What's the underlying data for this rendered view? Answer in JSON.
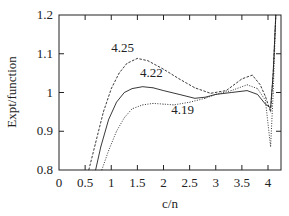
{
  "chart_data": {
    "type": "line",
    "title": "",
    "xlabel": "c/n",
    "ylabel": "Expt/function",
    "xlim": [
      0,
      4.3
    ],
    "ylim": [
      0.8,
      1.2
    ],
    "xticks": [
      0,
      0.5,
      1,
      1.5,
      2,
      2.5,
      3,
      3.5,
      4
    ],
    "xtick_labels": [
      "0",
      "0.5",
      "1",
      "1.5",
      "2",
      "2.5",
      "3",
      "3.5",
      "4"
    ],
    "yticks": [
      0.8,
      0.9,
      1.0,
      1.1,
      1.2
    ],
    "ytick_labels": [
      "0.8",
      "0.9",
      "1",
      "1.1",
      "1.2"
    ],
    "grid": false,
    "legend": "none",
    "series": [
      {
        "name": "4.25",
        "style": "dashed",
        "x": [
          0.57,
          0.7,
          0.85,
          1.0,
          1.15,
          1.3,
          1.5,
          1.7,
          2.0,
          2.3,
          2.6,
          2.9,
          3.2,
          3.5,
          3.7,
          3.85,
          3.95,
          4.05,
          4.1,
          4.15
        ],
        "y": [
          0.8,
          0.87,
          0.95,
          1.01,
          1.05,
          1.075,
          1.088,
          1.082,
          1.06,
          1.035,
          1.012,
          0.998,
          1.005,
          1.035,
          1.045,
          1.02,
          0.99,
          0.95,
          1.05,
          1.2
        ]
      },
      {
        "name": "4.22",
        "style": "solid",
        "x": [
          0.7,
          0.8,
          0.95,
          1.1,
          1.25,
          1.4,
          1.6,
          1.8,
          2.0,
          2.3,
          2.6,
          2.8,
          3.0,
          3.3,
          3.6,
          3.8,
          3.95,
          4.05,
          4.1,
          4.15
        ],
        "y": [
          0.8,
          0.86,
          0.93,
          0.975,
          1.0,
          1.01,
          1.015,
          1.012,
          1.005,
          0.995,
          0.985,
          0.988,
          0.995,
          1.0,
          1.005,
          0.995,
          0.97,
          0.96,
          1.05,
          1.2
        ]
      },
      {
        "name": "4.19",
        "style": "dotted",
        "x": [
          0.82,
          0.95,
          1.1,
          1.25,
          1.4,
          1.6,
          1.8,
          2.0,
          2.2,
          2.5,
          2.8,
          3.0,
          3.3,
          3.6,
          3.8,
          3.95,
          4.05,
          4.1,
          4.15
        ],
        "y": [
          0.8,
          0.85,
          0.9,
          0.935,
          0.958,
          0.968,
          0.972,
          0.97,
          0.968,
          0.975,
          0.985,
          0.995,
          1.005,
          1.02,
          1.01,
          0.98,
          0.86,
          1.0,
          1.2
        ]
      }
    ],
    "annotations": [
      {
        "text": "4.25",
        "x": 1.0,
        "y": 1.105
      },
      {
        "text": "4.22",
        "x": 1.55,
        "y": 1.04
      },
      {
        "text": "4.19",
        "x": 2.15,
        "y": 0.945
      }
    ]
  }
}
